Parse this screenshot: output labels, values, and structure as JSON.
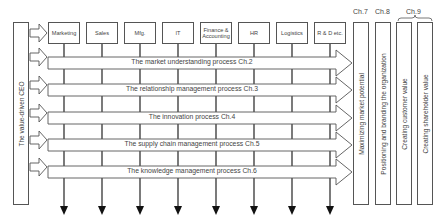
{
  "ceo": {
    "label": "The value-driven CEO"
  },
  "departments": [
    {
      "label": "Marketing"
    },
    {
      "label": "Sales"
    },
    {
      "label": "Mfg."
    },
    {
      "label": "IT"
    },
    {
      "label": "Finance & Accounting"
    },
    {
      "label": "HR"
    },
    {
      "label": "Logistics"
    },
    {
      "label": "R & D etc."
    }
  ],
  "processes": [
    {
      "label": "The market understanding process Ch.2"
    },
    {
      "label": "The relationship management process Ch.3"
    },
    {
      "label": "The innovation process Ch.4"
    },
    {
      "label": "The supply chain management process Ch.5"
    },
    {
      "label": "The knowledge management process Ch.6"
    }
  ],
  "outcomes": [
    {
      "chapter": "Ch.7",
      "label": "Maximizing market potential"
    },
    {
      "chapter": "Ch.8",
      "label": "Positioning and branding the organization"
    },
    {
      "chapter": "Ch.9",
      "label": "Creating customer value"
    },
    {
      "chapter": "",
      "label": "Creating shareholder value"
    }
  ],
  "colors": {
    "line": "#333333",
    "box_border": "#555555",
    "background": "#ffffff"
  }
}
